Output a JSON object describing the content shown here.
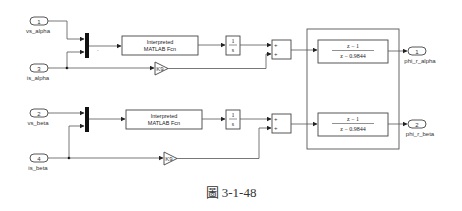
{
  "diagram": {
    "inports": [
      {
        "number": "1",
        "name": "vs_alpha"
      },
      {
        "number": "3",
        "name": "is_alpha"
      },
      {
        "number": "2",
        "name": "vs_beta"
      },
      {
        "number": "4",
        "name": "is_beta"
      }
    ],
    "outports": [
      {
        "number": "1",
        "name": "phi_r_alpha"
      },
      {
        "number": "2",
        "name": "phi_r_beta"
      }
    ],
    "fcn_block": {
      "line1": "Interpreted",
      "line2": "MATLAB Fcn"
    },
    "integrator": {
      "num": "1",
      "den": "s"
    },
    "gain": {
      "label": "K9"
    },
    "sum_signs": [
      "+",
      "+"
    ],
    "transfer_fcn": {
      "num": "z − 1",
      "den": "z − 0.9844"
    },
    "mux_dot": "."
  },
  "caption": "圖 3-1-48"
}
